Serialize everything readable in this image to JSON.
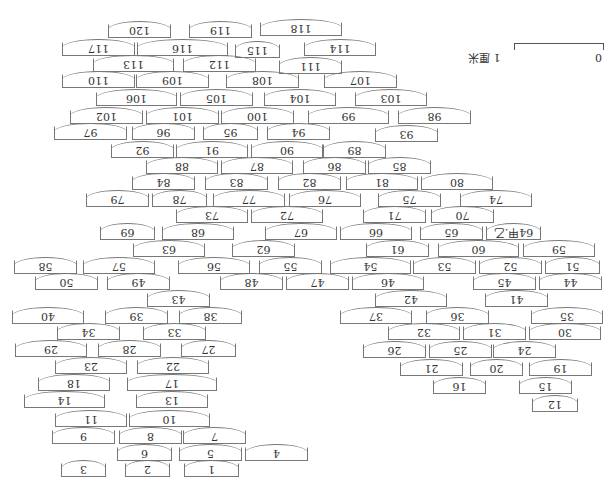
{
  "diagram": {
    "orientation": "rotated 180 degrees",
    "scale": {
      "label": "1 厘米",
      "zero": "0",
      "one": "1"
    },
    "boxes": [
      {
        "label": "120",
        "x": 108,
        "y": 24,
        "w": 63
      },
      {
        "label": "119",
        "x": 189,
        "y": 24,
        "w": 63
      },
      {
        "label": "118",
        "x": 260,
        "y": 22,
        "w": 82
      },
      {
        "label": "117",
        "x": 62,
        "y": 42,
        "w": 73
      },
      {
        "label": "116",
        "x": 137,
        "y": 42,
        "w": 91
      },
      {
        "label": "115",
        "x": 235,
        "y": 44,
        "w": 45
      },
      {
        "label": "114",
        "x": 304,
        "y": 42,
        "w": 72
      },
      {
        "label": "113",
        "x": 93,
        "y": 58,
        "w": 81
      },
      {
        "label": "112",
        "x": 183,
        "y": 58,
        "w": 73
      },
      {
        "label": "111",
        "x": 279,
        "y": 60,
        "w": 63
      },
      {
        "label": "110",
        "x": 62,
        "y": 74,
        "w": 73
      },
      {
        "label": "109",
        "x": 136,
        "y": 74,
        "w": 73
      },
      {
        "label": "108",
        "x": 226,
        "y": 74,
        "w": 73
      },
      {
        "label": "107",
        "x": 324,
        "y": 74,
        "w": 73
      },
      {
        "label": "106",
        "x": 96,
        "y": 92,
        "w": 81
      },
      {
        "label": "105",
        "x": 180,
        "y": 92,
        "w": 73
      },
      {
        "label": "104",
        "x": 264,
        "y": 92,
        "w": 72
      },
      {
        "label": "103",
        "x": 355,
        "y": 92,
        "w": 72
      },
      {
        "label": "102",
        "x": 70,
        "y": 110,
        "w": 73
      },
      {
        "label": "101",
        "x": 146,
        "y": 110,
        "w": 73
      },
      {
        "label": "100",
        "x": 221,
        "y": 110,
        "w": 73
      },
      {
        "label": "99",
        "x": 308,
        "y": 110,
        "w": 81
      },
      {
        "label": "98",
        "x": 398,
        "y": 110,
        "w": 73
      },
      {
        "label": "97",
        "x": 54,
        "y": 126,
        "w": 73
      },
      {
        "label": "96",
        "x": 132,
        "y": 126,
        "w": 63
      },
      {
        "label": "95",
        "x": 203,
        "y": 126,
        "w": 55
      },
      {
        "label": "94",
        "x": 267,
        "y": 126,
        "w": 63
      },
      {
        "label": "93",
        "x": 375,
        "y": 128,
        "w": 63
      },
      {
        "label": "92",
        "x": 111,
        "y": 144,
        "w": 63
      },
      {
        "label": "91",
        "x": 176,
        "y": 144,
        "w": 72
      },
      {
        "label": "90",
        "x": 251,
        "y": 144,
        "w": 72
      },
      {
        "label": "89",
        "x": 323,
        "y": 144,
        "w": 63
      },
      {
        "label": "88",
        "x": 146,
        "y": 160,
        "w": 72
      },
      {
        "label": "87",
        "x": 221,
        "y": 160,
        "w": 72
      },
      {
        "label": "86",
        "x": 303,
        "y": 160,
        "w": 63
      },
      {
        "label": "85",
        "x": 368,
        "y": 160,
        "w": 63
      },
      {
        "label": "84",
        "x": 132,
        "y": 176,
        "w": 63
      },
      {
        "label": "83",
        "x": 205,
        "y": 176,
        "w": 63
      },
      {
        "label": "82",
        "x": 278,
        "y": 176,
        "w": 63
      },
      {
        "label": "81",
        "x": 346,
        "y": 176,
        "w": 72
      },
      {
        "label": "80",
        "x": 421,
        "y": 176,
        "w": 72
      },
      {
        "label": "79",
        "x": 86,
        "y": 193,
        "w": 63
      },
      {
        "label": "78",
        "x": 152,
        "y": 193,
        "w": 55
      },
      {
        "label": "77",
        "x": 213,
        "y": 193,
        "w": 72
      },
      {
        "label": "76",
        "x": 289,
        "y": 193,
        "w": 72
      },
      {
        "label": "75",
        "x": 378,
        "y": 193,
        "w": 63
      },
      {
        "label": "74",
        "x": 460,
        "y": 193,
        "w": 72
      },
      {
        "label": "73",
        "x": 176,
        "y": 209,
        "w": 72
      },
      {
        "label": "72",
        "x": 251,
        "y": 209,
        "w": 72
      },
      {
        "label": "71",
        "x": 363,
        "y": 209,
        "w": 63
      },
      {
        "label": "70",
        "x": 431,
        "y": 209,
        "w": 63
      },
      {
        "label": "69",
        "x": 100,
        "y": 226,
        "w": 55
      },
      {
        "label": "68",
        "x": 162,
        "y": 226,
        "w": 72
      },
      {
        "label": "67",
        "x": 265,
        "y": 226,
        "w": 72
      },
      {
        "label": "66",
        "x": 340,
        "y": 226,
        "w": 72
      },
      {
        "label": "65",
        "x": 420,
        "y": 226,
        "w": 63
      },
      {
        "label": "64甲.乙",
        "x": 486,
        "y": 226,
        "w": 55
      },
      {
        "label": "63",
        "x": 133,
        "y": 243,
        "w": 72
      },
      {
        "label": "62",
        "x": 232,
        "y": 243,
        "w": 63
      },
      {
        "label": "61",
        "x": 366,
        "y": 243,
        "w": 63
      },
      {
        "label": "60",
        "x": 438,
        "y": 243,
        "w": 81
      },
      {
        "label": "59",
        "x": 523,
        "y": 243,
        "w": 72
      },
      {
        "label": "58",
        "x": 14,
        "y": 260,
        "w": 63
      },
      {
        "label": "57",
        "x": 83,
        "y": 260,
        "w": 72
      },
      {
        "label": "56",
        "x": 178,
        "y": 260,
        "w": 72
      },
      {
        "label": "55",
        "x": 259,
        "y": 260,
        "w": 63
      },
      {
        "label": "54",
        "x": 330,
        "y": 260,
        "w": 81
      },
      {
        "label": "53",
        "x": 413,
        "y": 260,
        "w": 63
      },
      {
        "label": "52",
        "x": 479,
        "y": 260,
        "w": 63
      },
      {
        "label": "51",
        "x": 545,
        "y": 260,
        "w": 55
      },
      {
        "label": "50",
        "x": 35,
        "y": 276,
        "w": 63
      },
      {
        "label": "49",
        "x": 107,
        "y": 276,
        "w": 63
      },
      {
        "label": "48",
        "x": 220,
        "y": 276,
        "w": 63
      },
      {
        "label": "47",
        "x": 286,
        "y": 276,
        "w": 63
      },
      {
        "label": "46",
        "x": 352,
        "y": 276,
        "w": 72
      },
      {
        "label": "45",
        "x": 473,
        "y": 276,
        "w": 63
      },
      {
        "label": "44",
        "x": 539,
        "y": 276,
        "w": 63
      },
      {
        "label": "43",
        "x": 147,
        "y": 293,
        "w": 63
      },
      {
        "label": "42",
        "x": 375,
        "y": 293,
        "w": 72
      },
      {
        "label": "41",
        "x": 485,
        "y": 293,
        "w": 63
      },
      {
        "label": "40",
        "x": 12,
        "y": 310,
        "w": 72
      },
      {
        "label": "39",
        "x": 105,
        "y": 310,
        "w": 63
      },
      {
        "label": "38",
        "x": 179,
        "y": 310,
        "w": 63
      },
      {
        "label": "37",
        "x": 340,
        "y": 310,
        "w": 72
      },
      {
        "label": "36",
        "x": 426,
        "y": 310,
        "w": 63
      },
      {
        "label": "35",
        "x": 531,
        "y": 310,
        "w": 72
      },
      {
        "label": "34",
        "x": 57,
        "y": 326,
        "w": 63
      },
      {
        "label": "33",
        "x": 143,
        "y": 326,
        "w": 63
      },
      {
        "label": "32",
        "x": 388,
        "y": 326,
        "w": 72
      },
      {
        "label": "31",
        "x": 463,
        "y": 326,
        "w": 63
      },
      {
        "label": "30",
        "x": 529,
        "y": 326,
        "w": 72
      },
      {
        "label": "29",
        "x": 15,
        "y": 343,
        "w": 72
      },
      {
        "label": "28",
        "x": 98,
        "y": 343,
        "w": 63
      },
      {
        "label": "27",
        "x": 181,
        "y": 343,
        "w": 55
      },
      {
        "label": "26",
        "x": 363,
        "y": 344,
        "w": 63
      },
      {
        "label": "25",
        "x": 429,
        "y": 344,
        "w": 63
      },
      {
        "label": "24",
        "x": 493,
        "y": 344,
        "w": 63
      },
      {
        "label": "23",
        "x": 55,
        "y": 360,
        "w": 72
      },
      {
        "label": "22",
        "x": 137,
        "y": 360,
        "w": 72
      },
      {
        "label": "21",
        "x": 400,
        "y": 362,
        "w": 63
      },
      {
        "label": "20",
        "x": 470,
        "y": 362,
        "w": 53
      },
      {
        "label": "19",
        "x": 529,
        "y": 362,
        "w": 63
      },
      {
        "label": "18",
        "x": 38,
        "y": 377,
        "w": 72
      },
      {
        "label": "17",
        "x": 127,
        "y": 377,
        "w": 90
      },
      {
        "label": "16",
        "x": 433,
        "y": 380,
        "w": 53
      },
      {
        "label": "15",
        "x": 519,
        "y": 380,
        "w": 53
      },
      {
        "label": "14",
        "x": 24,
        "y": 394,
        "w": 81
      },
      {
        "label": "13",
        "x": 136,
        "y": 394,
        "w": 72
      },
      {
        "label": "12",
        "x": 532,
        "y": 398,
        "w": 46
      },
      {
        "label": "11",
        "x": 55,
        "y": 413,
        "w": 72
      },
      {
        "label": "10",
        "x": 129,
        "y": 413,
        "w": 81
      },
      {
        "label": "9",
        "x": 52,
        "y": 430,
        "w": 63
      },
      {
        "label": "8",
        "x": 119,
        "y": 430,
        "w": 63
      },
      {
        "label": "7",
        "x": 183,
        "y": 430,
        "w": 63
      },
      {
        "label": "6",
        "x": 117,
        "y": 447,
        "w": 55
      },
      {
        "label": "5",
        "x": 179,
        "y": 447,
        "w": 63
      },
      {
        "label": "4",
        "x": 245,
        "y": 447,
        "w": 63
      },
      {
        "label": "3",
        "x": 61,
        "y": 463,
        "w": 45
      },
      {
        "label": "2",
        "x": 125,
        "y": 463,
        "w": 45
      },
      {
        "label": "1",
        "x": 184,
        "y": 463,
        "w": 55
      }
    ]
  }
}
